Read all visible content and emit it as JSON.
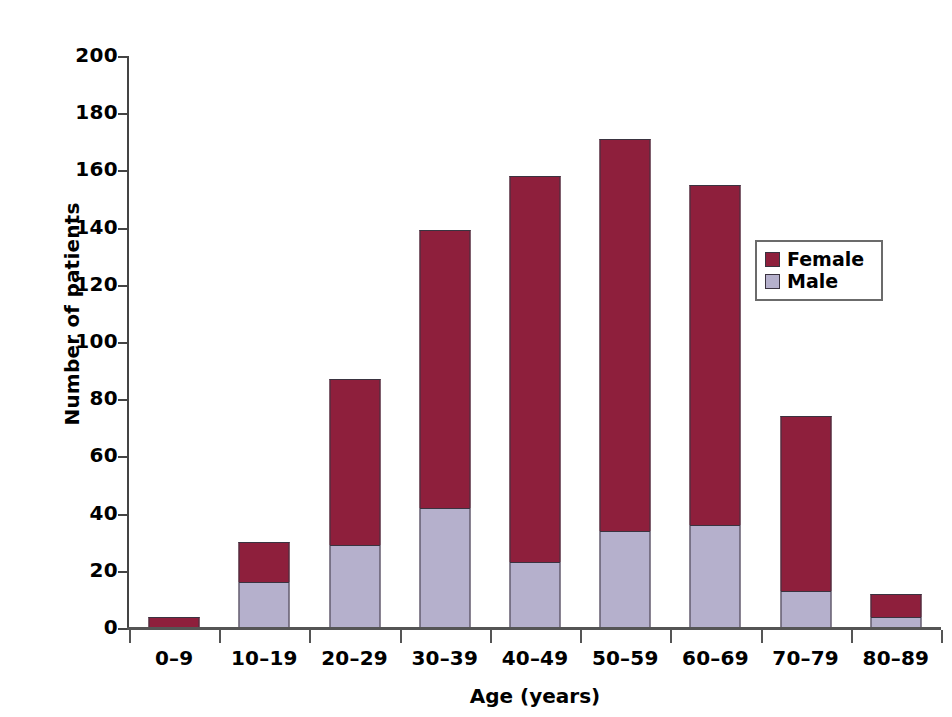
{
  "chart_data": {
    "type": "bar",
    "subtype": "stacked",
    "title": "",
    "xlabel": "Age (years)",
    "ylabel": "Number of patients",
    "categories": [
      "0–9",
      "10–19",
      "20–29",
      "30–39",
      "40–49",
      "50–59",
      "60–69",
      "70–79",
      "80–89"
    ],
    "series": [
      {
        "name": "Female",
        "color": "#8E1F3C",
        "values": [
          4,
          14,
          58,
          97,
          135,
          137,
          119,
          61,
          8
        ]
      },
      {
        "name": "Male",
        "color": "#B5B0CC",
        "values": [
          0,
          16,
          29,
          42,
          23,
          34,
          36,
          13,
          4
        ]
      }
    ],
    "totals": [
      4,
      30,
      87,
      139,
      158,
      171,
      155,
      74,
      12
    ],
    "ylim": [
      0,
      200
    ],
    "ytick_values": [
      0,
      20,
      40,
      60,
      80,
      100,
      120,
      140,
      160,
      180,
      200
    ],
    "ytick_labels": [
      "0",
      "20",
      "40",
      "60",
      "80",
      "100",
      "120",
      "140",
      "160",
      "180",
      "200"
    ],
    "grid": false,
    "legend_position": "upper right",
    "legend_entries": [
      "Female",
      "Male"
    ]
  },
  "axes": {
    "y_title": "Number of patients",
    "x_title": "Age (years)"
  },
  "legend": {
    "items": [
      {
        "label": "Female"
      },
      {
        "label": "Male"
      }
    ]
  },
  "colors": {
    "female": "#8E1F3C",
    "male": "#B5B0CC",
    "bar_outline": "#3a3340",
    "axis": "#555555",
    "legend_border": "#6b6b6b",
    "background": "#ffffff"
  }
}
